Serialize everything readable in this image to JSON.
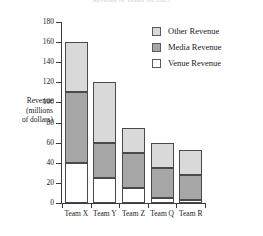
{
  "chart_data": {
    "type": "bar",
    "subtype": "stacked-vertical",
    "title": "Revenue of Teams for 2005",
    "xlabel": "",
    "ylabel": "Revenue (millions of dollars)",
    "ylabel_lines": [
      "Revenue",
      "(millions",
      "of dollars)"
    ],
    "categories": [
      "Team X",
      "Team Y",
      "Team Z",
      "Team Q",
      "Team R"
    ],
    "series": [
      {
        "name": "Venue Revenue",
        "color": "#ffffff",
        "values": [
          40,
          25,
          15,
          5,
          3
        ]
      },
      {
        "name": "Media Revenue",
        "color": "#a6a6a6",
        "values": [
          70,
          35,
          35,
          30,
          25
        ]
      },
      {
        "name": "Other Revenue",
        "color": "#d9d9d9",
        "values": [
          50,
          60,
          25,
          25,
          25
        ]
      }
    ],
    "totals": [
      160,
      120,
      75,
      60,
      53
    ],
    "ylim": [
      0,
      180
    ],
    "ytick_labels": [
      "0",
      "20",
      "40",
      "60",
      "80",
      "100",
      "120",
      "140",
      "160",
      "180"
    ],
    "ytick_values": [
      0,
      20,
      40,
      60,
      80,
      100,
      120,
      140,
      160,
      180
    ],
    "grid": false,
    "legend_position": "top-right",
    "legend_order": [
      "Other Revenue",
      "Media Revenue",
      "Venue Revenue"
    ]
  },
  "legend": {
    "items": [
      {
        "label": "Other Revenue",
        "color": "#d9d9d9"
      },
      {
        "label": "Media Revenue",
        "color": "#a6a6a6"
      },
      {
        "label": "Venue Revenue",
        "color": "#ffffff"
      }
    ]
  },
  "axis": {
    "y_label_line1": "Revenue",
    "y_label_line2": "(millions",
    "y_label_line3": "of dollars)"
  }
}
